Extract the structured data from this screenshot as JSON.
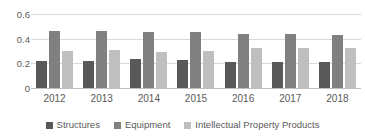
{
  "chart_data": {
    "type": "bar",
    "title": "",
    "subtitle": "",
    "xlabel": "",
    "ylabel": "",
    "categories": [
      "2012",
      "2013",
      "2014",
      "2015",
      "2016",
      "2017",
      "2018"
    ],
    "series": [
      {
        "name": "Structures",
        "color": "#595959",
        "values": [
          0.22,
          0.215,
          0.235,
          0.225,
          0.21,
          0.212,
          0.212
        ]
      },
      {
        "name": "Equipment",
        "color": "#808080",
        "values": [
          0.462,
          0.462,
          0.455,
          0.455,
          0.44,
          0.435,
          0.432
        ]
      },
      {
        "name": "Intellectual Property Products",
        "color": "#bfbfbf",
        "values": [
          0.302,
          0.305,
          0.295,
          0.3,
          0.325,
          0.322,
          0.325
        ]
      }
    ],
    "ylim": [
      0,
      0.6
    ],
    "yticks": [
      "0",
      "0.2",
      "0.4",
      "0.6"
    ],
    "ytick_values": [
      0,
      0.2,
      0.4,
      0.6
    ],
    "grid": true,
    "legend_position": "bottom"
  }
}
